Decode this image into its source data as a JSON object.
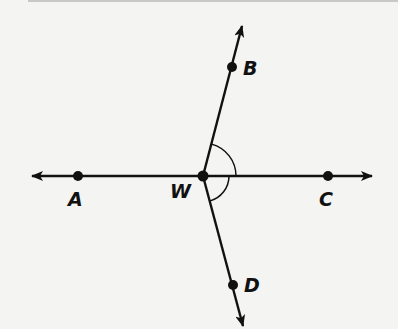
{
  "diagram": {
    "type": "geometry-rays",
    "vertex": {
      "label": "W",
      "x": 203,
      "y": 176
    },
    "points": [
      {
        "label": "A",
        "x": 78,
        "y": 176,
        "label_x": 68,
        "label_y": 206
      },
      {
        "label": "B",
        "x": 232,
        "y": 67,
        "label_x": 243,
        "label_y": 75
      },
      {
        "label": "C",
        "x": 328,
        "y": 176,
        "label_x": 319,
        "label_y": 206
      },
      {
        "label": "D",
        "x": 233,
        "y": 285,
        "label_x": 244,
        "label_y": 292
      }
    ],
    "rays": [
      {
        "name": "WA",
        "to": "A"
      },
      {
        "name": "WB",
        "to": "B"
      },
      {
        "name": "WC",
        "to": "C"
      },
      {
        "name": "WD",
        "to": "D"
      }
    ],
    "angle_marks": [
      {
        "angle": "BWC",
        "arcs": 1
      },
      {
        "angle": "CWD",
        "arcs": 1
      }
    ],
    "colors": {
      "line": "#111111",
      "background": "#f4f4f2"
    }
  }
}
